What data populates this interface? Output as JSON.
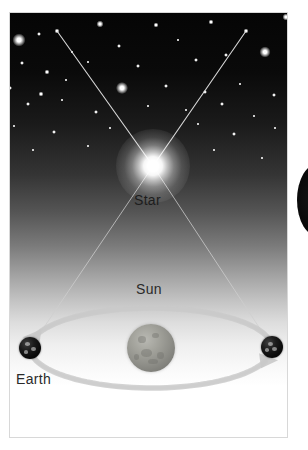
{
  "figure": {
    "kind": "stellar-parallax-diagram",
    "title_visible": false,
    "background_color": "#ffffff",
    "frame_color": "#d8d8d8"
  },
  "labels": {
    "star": "Star",
    "sun": "Sun",
    "earth": "Earth"
  },
  "colors": {
    "sky_top": "#050505",
    "sky_bottom": "#ffffff",
    "star_glow": "#ffffff",
    "sightline": "#cfcfcf",
    "orbit_arrow": "#c9c9c9",
    "earth_body": "#0a0a0a",
    "sun_body": "#9a9a94",
    "label_text": "#1d1d1d"
  },
  "chart_data": {
    "type": "scatter",
    "xlabel": "",
    "ylabel": "",
    "objects": [
      {
        "name": "Star",
        "label": "Star",
        "x": 153,
        "y": 166,
        "radius": 9,
        "role": "nearby-target-star"
      },
      {
        "name": "Sun",
        "label": "Sun",
        "x": 151,
        "y": 348,
        "radius": 24,
        "role": "central-body"
      },
      {
        "name": "Earth-left",
        "label": "Earth",
        "x": 30,
        "y": 348,
        "radius": 11,
        "role": "observer-position-1"
      },
      {
        "name": "Earth-right",
        "label": "",
        "x": 272,
        "y": 347,
        "radius": 11,
        "role": "observer-position-2"
      }
    ],
    "sightlines": [
      {
        "from": "Earth-left",
        "through": "Star",
        "to_background_star_x": 57,
        "to_background_star_y": 31
      },
      {
        "from": "Earth-right",
        "through": "Star",
        "to_background_star_x": 246,
        "to_background_star_y": 31
      }
    ],
    "orbit": {
      "center_x": 151,
      "center_y": 348,
      "semi_major_axis": 121,
      "semi_minor_axis": 40,
      "arrow_upper_direction": "left",
      "arrow_lower_direction": "right"
    },
    "background_stars": [
      {
        "x": 19,
        "y": 40,
        "size": 13
      },
      {
        "x": 57,
        "y": 31,
        "size": 5
      },
      {
        "x": 100,
        "y": 24,
        "size": 7
      },
      {
        "x": 156,
        "y": 25,
        "size": 5
      },
      {
        "x": 211,
        "y": 22,
        "size": 5
      },
      {
        "x": 246,
        "y": 31,
        "size": 5
      },
      {
        "x": 286,
        "y": 17,
        "size": 7
      },
      {
        "x": 39,
        "y": 34,
        "size": 4
      },
      {
        "x": 72,
        "y": 52,
        "size": 3
      },
      {
        "x": 119,
        "y": 46,
        "size": 4
      },
      {
        "x": 178,
        "y": 40,
        "size": 3
      },
      {
        "x": 265,
        "y": 52,
        "size": 11
      },
      {
        "x": 22,
        "y": 63,
        "size": 4
      },
      {
        "x": 47,
        "y": 72,
        "size": 5
      },
      {
        "x": 88,
        "y": 62,
        "size": 3
      },
      {
        "x": 138,
        "y": 66,
        "size": 4
      },
      {
        "x": 196,
        "y": 60,
        "size": 4
      },
      {
        "x": 226,
        "y": 55,
        "size": 4
      },
      {
        "x": 10,
        "y": 88,
        "size": 4
      },
      {
        "x": 41,
        "y": 94,
        "size": 5
      },
      {
        "x": 66,
        "y": 80,
        "size": 3
      },
      {
        "x": 122,
        "y": 88,
        "size": 12
      },
      {
        "x": 166,
        "y": 86,
        "size": 4
      },
      {
        "x": 205,
        "y": 92,
        "size": 4
      },
      {
        "x": 240,
        "y": 84,
        "size": 3
      },
      {
        "x": 274,
        "y": 95,
        "size": 4
      },
      {
        "x": 28,
        "y": 104,
        "size": 4
      },
      {
        "x": 62,
        "y": 100,
        "size": 3
      },
      {
        "x": 96,
        "y": 112,
        "size": 4
      },
      {
        "x": 148,
        "y": 106,
        "size": 3
      },
      {
        "x": 186,
        "y": 110,
        "size": 3
      },
      {
        "x": 222,
        "y": 104,
        "size": 4
      },
      {
        "x": 254,
        "y": 116,
        "size": 3
      },
      {
        "x": 14,
        "y": 126,
        "size": 3
      },
      {
        "x": 54,
        "y": 132,
        "size": 4
      },
      {
        "x": 110,
        "y": 128,
        "size": 3
      },
      {
        "x": 198,
        "y": 124,
        "size": 3
      },
      {
        "x": 234,
        "y": 134,
        "size": 4
      },
      {
        "x": 275,
        "y": 128,
        "size": 3
      },
      {
        "x": 33,
        "y": 150,
        "size": 3
      },
      {
        "x": 88,
        "y": 146,
        "size": 3
      },
      {
        "x": 214,
        "y": 150,
        "size": 3
      },
      {
        "x": 262,
        "y": 158,
        "size": 3
      }
    ]
  }
}
